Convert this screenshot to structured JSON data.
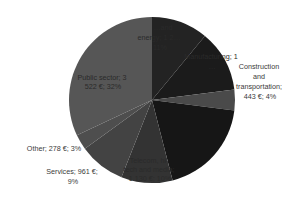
{
  "chart_data": {
    "type": "pie",
    "title": "",
    "start": "12 o'clock",
    "direction": "clockwise",
    "currency": "€",
    "slices": [
      {
        "name": "Energy",
        "label_lines": [
          "…and",
          "energy; 1 2…",
          "11%"
        ],
        "percent": 11,
        "color": "#232323"
      },
      {
        "name": "Manufacturing",
        "label_lines": [
          "Manufacturing; 1",
          "…"
        ],
        "percent": 12,
        "color": "#1b1b1b"
      },
      {
        "name": "Construction and transportation",
        "label_lines": [
          "Construction",
          "and",
          "transportation;",
          "443 €; 4%"
        ],
        "value": 443,
        "percent": 4,
        "color": "#4a4a4a"
      },
      {
        "name": "",
        "label_lines": [],
        "percent": 19,
        "color": "#161616"
      },
      {
        "name": "Telecom, hi-tech and media",
        "label_lines": [
          "Telecom, hi-",
          "tech and media;",
          "1 130 €; 10%"
        ],
        "value": 1130,
        "percent": 10,
        "color": "#333333"
      },
      {
        "name": "Services",
        "label_lines": [
          "Services; 961 €;",
          "9%"
        ],
        "value": 961,
        "percent": 9,
        "color": "#434343"
      },
      {
        "name": "Other",
        "label_lines": [
          "Other; 278 €; 3%"
        ],
        "value": 278,
        "percent": 3,
        "color": "#4e4e4e"
      },
      {
        "name": "Public sector",
        "label_lines": [
          "Public sector; 3",
          "522 €; 32%"
        ],
        "value": 3522,
        "percent": 32,
        "color": "#565656"
      }
    ]
  }
}
